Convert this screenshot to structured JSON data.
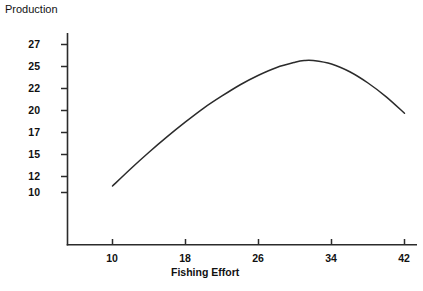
{
  "chart_data": {
    "type": "line",
    "title": "",
    "ylabel": "Production",
    "xlabel": "Fishing Effort",
    "grid": false,
    "legend": "none",
    "xtick_labels": [
      "10",
      "18",
      "26",
      "34",
      "42"
    ],
    "ytick_labels": [
      "27",
      "25",
      "22",
      "20",
      "17",
      "15",
      "12",
      "10"
    ],
    "xlim": [
      6,
      46
    ],
    "ylim": [
      9,
      28
    ],
    "x": [
      10,
      12,
      14,
      16,
      18,
      20,
      22,
      24,
      26,
      28,
      30,
      31,
      32,
      34,
      36,
      38,
      40,
      42
    ],
    "y": [
      11.5,
      13.5,
      15.4,
      17.2,
      18.9,
      20.5,
      21.9,
      23.2,
      24.3,
      25.2,
      25.8,
      26.0,
      26.0,
      25.6,
      24.7,
      23.4,
      21.8,
      19.9
    ],
    "series": [
      {
        "name": "Production",
        "values": [
          11.5,
          13.5,
          15.4,
          17.2,
          18.9,
          20.5,
          21.9,
          23.2,
          24.3,
          25.2,
          25.8,
          26.0,
          26.0,
          25.6,
          24.7,
          23.4,
          21.8,
          19.9
        ]
      }
    ],
    "annotations": [],
    "peak": {
      "x": 31.5,
      "y": 26.0
    },
    "line_color": "#2b2b2b",
    "axis_color": "#2b2b2b",
    "background_color": "#ffffff"
  },
  "axes": {
    "y_axis_name": "y-axis",
    "x_axis_name": "x-axis"
  }
}
